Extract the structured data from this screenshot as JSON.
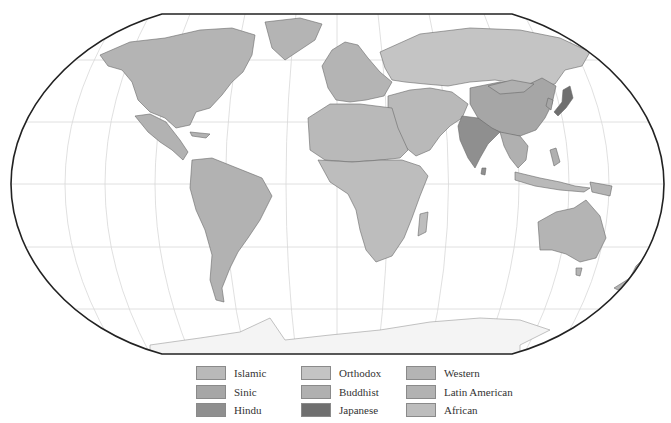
{
  "map": {
    "projection": "Robinson",
    "frame_color": "#222222",
    "ocean_color": "#ffffff",
    "graticule_color": "#d6d6d6",
    "border_color": "#6a6a6a"
  },
  "civilizations": {
    "Islamic": "#b9b9b9",
    "Sinic": "#a6a6a6",
    "Hindu": "#8f8f8f",
    "Orthodox": "#c4c4c4",
    "Buddhist": "#b0b0b0",
    "Japanese": "#6f6f6f",
    "Western": "#b4b4b4",
    "Latin American": "#b2b2b2",
    "African": "#bdbdbd"
  },
  "legend": {
    "items": [
      {
        "label": "Islamic",
        "color": "#b9b9b9"
      },
      {
        "label": "Orthodox",
        "color": "#c4c4c4"
      },
      {
        "label": "Western",
        "color": "#b4b4b4"
      },
      {
        "label": "Sinic",
        "color": "#a6a6a6"
      },
      {
        "label": "Buddhist",
        "color": "#b0b0b0"
      },
      {
        "label": "Latin American",
        "color": "#b2b2b2"
      },
      {
        "label": "Hindu",
        "color": "#8f8f8f"
      },
      {
        "label": "Japanese",
        "color": "#6f6f6f"
      },
      {
        "label": "African",
        "color": "#bdbdbd"
      }
    ]
  }
}
